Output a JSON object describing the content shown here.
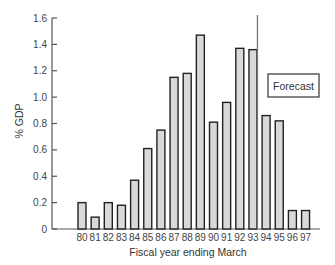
{
  "chart_data": {
    "type": "bar",
    "title": "",
    "xlabel": "Fiscal year ending March",
    "ylabel": "% GDP",
    "ylim": [
      0,
      1.6
    ],
    "yticks": [
      "0",
      "0.2",
      "0.4",
      "0.6",
      "0.8",
      "1.0",
      "1.2",
      "1.4",
      "1.6"
    ],
    "categories": [
      "80",
      "81",
      "82",
      "83",
      "84",
      "85",
      "86",
      "87",
      "88",
      "89",
      "90",
      "91",
      "92",
      "93",
      "94",
      "95",
      "96",
      "97"
    ],
    "values": [
      0.2,
      0.09,
      0.2,
      0.18,
      0.37,
      0.61,
      0.75,
      1.15,
      1.18,
      1.47,
      0.81,
      0.96,
      1.37,
      1.36,
      0.86,
      0.82,
      0.14,
      0.14
    ],
    "grid": false,
    "annotations": [
      {
        "text": "Forecast",
        "type": "boxed-label",
        "divider_after_category": "93"
      }
    ],
    "colors": {
      "bar_fill": "#d9d9d9",
      "bar_stroke": "#222222"
    }
  }
}
